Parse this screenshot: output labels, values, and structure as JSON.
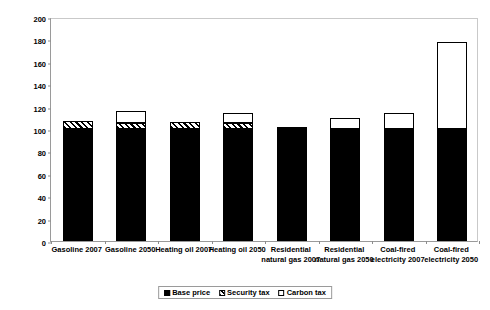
{
  "chart_data": {
    "type": "bar",
    "stacked": true,
    "title": "",
    "xlabel": "",
    "ylabel": "Price Index (2007 Price = 100)",
    "ylim": [
      0,
      200
    ],
    "yticks": [
      0,
      20,
      40,
      60,
      80,
      100,
      120,
      140,
      160,
      180,
      200
    ],
    "grid": false,
    "legend_position": "bottom-center",
    "categories": [
      "Gasoline 2007",
      "Gasoline 2050",
      "Heating oil 2007",
      "Heating oil 2050",
      "Residential natural gas 2007",
      "Residential natural gas 2050",
      "Coal-fired electricity 2007",
      "Coal-fired electricity 2050"
    ],
    "series": [
      {
        "name": "Base price",
        "pattern": "solid-black",
        "color": "#000000",
        "values": [
          100,
          100,
          100,
          100,
          100,
          100,
          100,
          100
        ]
      },
      {
        "name": "Security tax",
        "pattern": "diagonal-hatch",
        "color": "#ffffff",
        "values": [
          7,
          5,
          6,
          5,
          2,
          0,
          0,
          0
        ]
      },
      {
        "name": "Carbon tax",
        "pattern": "solid-white",
        "color": "#ffffff",
        "values": [
          0,
          11,
          0,
          9,
          0,
          10,
          14,
          78
        ]
      }
    ],
    "totals": [
      107,
      116,
      106,
      114,
      102,
      110,
      114,
      178
    ]
  },
  "axis": {
    "y_tick_labels": [
      "200",
      "180",
      "160",
      "140",
      "120",
      "100",
      "80",
      "60",
      "40",
      "20",
      "0"
    ],
    "y_title": "Price Index (2007 Price = 100)"
  },
  "legend": {
    "items": [
      {
        "label": "Base price",
        "swatch": "solid-black-swatch"
      },
      {
        "label": "Security tax",
        "swatch": "hatched-swatch"
      },
      {
        "label": "Carbon tax",
        "swatch": "white-swatch"
      }
    ]
  }
}
